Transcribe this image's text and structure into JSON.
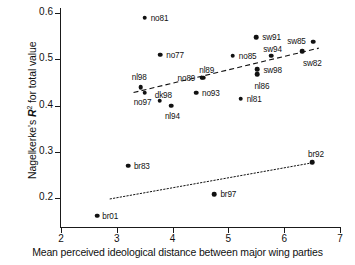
{
  "chart_data": {
    "type": "scatter",
    "title": "",
    "xlabel": "Mean perceived ideological distance between major wing parties",
    "ylabel": "Nagelkerke's R² for total value",
    "ylabel_parts": {
      "prefix": "Nagelkerke's ",
      "symbol": "R",
      "sup": "2",
      "suffix": " for total value"
    },
    "xlim": [
      2,
      7
    ],
    "ylim": [
      0.155,
      0.6
    ],
    "grid": false,
    "legend": null,
    "xticks": [
      2,
      3,
      4,
      5,
      6,
      7
    ],
    "xticklabels": [
      "2",
      "3",
      "4",
      "5",
      "6",
      "7"
    ],
    "yticks": [
      0.2,
      0.3,
      0.4,
      0.5,
      0.6
    ],
    "yticklabels": [
      "0.2",
      "0.3",
      "0.4",
      "0.5",
      "0.6"
    ],
    "point_color": "#111111",
    "points": [
      {
        "label": "no81",
        "x": 3.5,
        "y": 0.59,
        "lx": 6,
        "ly": -4
      },
      {
        "label": "no77",
        "x": 3.78,
        "y": 0.51,
        "lx": 6,
        "ly": -4
      },
      {
        "label": "nl98",
        "x": 3.43,
        "y": 0.44,
        "lx": -9,
        "ly": -14
      },
      {
        "label": "no97",
        "x": 3.5,
        "y": 0.428,
        "lx": -11,
        "ly": 5
      },
      {
        "label": "dk98",
        "x": 3.77,
        "y": 0.41,
        "lx": -5,
        "ly": -10
      },
      {
        "label": "nl94",
        "x": 3.97,
        "y": 0.4,
        "lx": -6,
        "ly": 6
      },
      {
        "label": "no89",
        "x": 4.52,
        "y": 0.46,
        "lx": -24,
        "ly": -4
      },
      {
        "label": "nl89",
        "x": 4.55,
        "y": 0.46,
        "lx": -4,
        "ly": -12
      },
      {
        "label": "no93",
        "x": 4.42,
        "y": 0.428,
        "lx": 6,
        "ly": -4
      },
      {
        "label": "no85",
        "x": 5.08,
        "y": 0.508,
        "lx": 6,
        "ly": -4
      },
      {
        "label": "sw91",
        "x": 5.5,
        "y": 0.548,
        "lx": 6,
        "ly": -4
      },
      {
        "label": "sw94",
        "x": 5.77,
        "y": 0.508,
        "lx": -8,
        "ly": -11
      },
      {
        "label": "sw98",
        "x": 5.52,
        "y": 0.478,
        "lx": 6,
        "ly": -3
      },
      {
        "label": "nl86",
        "x": 5.52,
        "y": 0.468,
        "lx": -3,
        "ly": 8
      },
      {
        "label": "nl81",
        "x": 5.22,
        "y": 0.415,
        "lx": 6,
        "ly": -4
      },
      {
        "label": "sw85",
        "x": 6.52,
        "y": 0.538,
        "lx": -26,
        "ly": -5
      },
      {
        "label": "sw82",
        "x": 6.32,
        "y": 0.518,
        "lx": 1,
        "ly": 8
      },
      {
        "label": "br83",
        "x": 3.2,
        "y": 0.27,
        "lx": 6,
        "ly": -4
      },
      {
        "label": "br92",
        "x": 6.5,
        "y": 0.277,
        "lx": -4,
        "ly": -12
      },
      {
        "label": "br97",
        "x": 4.75,
        "y": 0.208,
        "lx": 6,
        "ly": -4
      },
      {
        "label": "br01",
        "x": 2.65,
        "y": 0.162,
        "lx": 5,
        "ly": -4
      }
    ],
    "trend_lines": [
      {
        "name": "upper-dashed-trend",
        "style": "dashed",
        "x1": 3.3,
        "y1": 0.428,
        "x2": 6.62,
        "y2": 0.524
      },
      {
        "name": "lower-dotted-trend",
        "style": "dotted",
        "x1": 2.88,
        "y1": 0.198,
        "x2": 6.5,
        "y2": 0.276
      }
    ]
  }
}
